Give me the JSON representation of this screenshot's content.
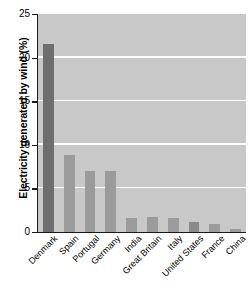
{
  "chart_data": {
    "type": "bar",
    "title": "",
    "xlabel": "",
    "ylabel": "Electricity generated by wind (%)",
    "ylim": [
      0,
      25
    ],
    "yticks": [
      0,
      5,
      10,
      15,
      20,
      25
    ],
    "ytick_labels": [
      "0",
      "5",
      "10",
      "15",
      "20",
      "25"
    ],
    "grid": "horizontal white gridlines at 5, 10, 15, 20",
    "legend": "none",
    "categories": [
      "Denmark",
      "Spain",
      "Portugal",
      "Germany",
      "India",
      "Great Britain",
      "Italy",
      "United States",
      "France",
      "China"
    ],
    "values": [
      21.6,
      8.8,
      7.0,
      7.0,
      1.6,
      1.7,
      1.6,
      1.1,
      0.9,
      0.3
    ],
    "bar_colors": [
      "#6e6e6e",
      "#9b9b9b",
      "#9b9b9b",
      "#9b9b9b",
      "#9b9b9b",
      "#9b9b9b",
      "#9b9b9b",
      "#8a8a8a",
      "#9b9b9b",
      "#9b9b9b"
    ],
    "plot_background": "#c8c8c8",
    "gridline_color": "#ffffff",
    "axis_color": "#1a1a1a",
    "highlight_category": "Denmark"
  }
}
